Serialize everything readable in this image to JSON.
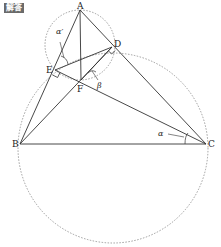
{
  "badge": {
    "label": "解答"
  },
  "colors": {
    "line": "#333333",
    "dashed": "#888888",
    "badge_bg": "#6a6a6a"
  },
  "points": {
    "A": {
      "label": "A",
      "x": 80,
      "y": 10
    },
    "B": {
      "label": "B",
      "x": 20,
      "y": 144
    },
    "C": {
      "label": "C",
      "x": 206,
      "y": 144
    },
    "D": {
      "label": "D",
      "x": 112,
      "y": 47
    },
    "E": {
      "label": "E",
      "x": 55,
      "y": 70
    },
    "F": {
      "label": "F",
      "x": 81,
      "y": 80
    }
  },
  "angles": {
    "alpha_prime": "α′",
    "beta": "β",
    "alpha": "α"
  },
  "circles": [
    {
      "name": "small-circle-AF",
      "cx": 80,
      "cy": 45,
      "r": 35
    },
    {
      "name": "large-circle-BCDE",
      "cx": 113,
      "cy": 148,
      "r": 95
    }
  ]
}
